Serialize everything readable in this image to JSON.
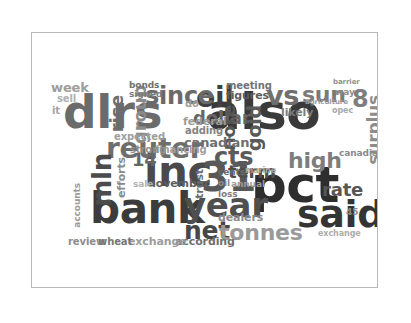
{
  "figure": {
    "background_color": "#ffffff",
    "axes_background_color": "#ffffff",
    "axes_border_color": "#b8b8b8",
    "title": "",
    "xlabel": "",
    "ylabel": ""
  },
  "chart_data": {
    "type": "wordcloud",
    "title": "",
    "subtitle": "",
    "xlabel": "",
    "ylabel": "",
    "legend": [],
    "grid": false,
    "axis_ticks_visible": false,
    "background_color": "#ffffff",
    "colormap": "grayscale",
    "words": [
      {
        "text": "dlrs",
        "weight": 100,
        "size": 47,
        "color": "#6b6b6b",
        "x": 31,
        "y": 56,
        "rotate": 0
      },
      {
        "text": "also",
        "weight": 97,
        "size": 50,
        "color": "#3a3a3a",
        "x": 175,
        "y": 55,
        "rotate": 0
      },
      {
        "text": "pct",
        "weight": 95,
        "size": 50,
        "color": "#2e2e2e",
        "x": 219,
        "y": 128,
        "rotate": 0
      },
      {
        "text": "bank",
        "weight": 88,
        "size": 42,
        "color": "#3c3c3c",
        "x": 58,
        "y": 155,
        "rotate": 0
      },
      {
        "text": "said",
        "weight": 84,
        "size": 38,
        "color": "#343434",
        "x": 265,
        "y": 163,
        "rotate": 0
      },
      {
        "text": "inc",
        "weight": 80,
        "size": 42,
        "color": "#4a4a4a",
        "x": 112,
        "y": 118,
        "rotate": 0
      },
      {
        "text": "31",
        "weight": 76,
        "size": 40,
        "color": "#585858",
        "x": 169,
        "y": 125,
        "rotate": 0
      },
      {
        "text": "year",
        "weight": 74,
        "size": 34,
        "color": "#4f4f4f",
        "x": 152,
        "y": 156,
        "rotate": 0
      },
      {
        "text": "reuter",
        "weight": 70,
        "size": 28,
        "color": "#6e6e6e",
        "x": 74,
        "y": 102,
        "rotate": 0
      },
      {
        "text": "oil",
        "weight": 66,
        "size": 28,
        "color": "#3f3f3f",
        "x": 164,
        "y": 51,
        "rotate": 0
      },
      {
        "text": "since",
        "weight": 62,
        "size": 24,
        "color": "#6a6a6a",
        "x": 113,
        "y": 52,
        "rotate": 0
      },
      {
        "text": "vs",
        "weight": 60,
        "size": 27,
        "color": "#6f6f6f",
        "x": 234,
        "y": 50,
        "rotate": 0
      },
      {
        "text": "net",
        "weight": 57,
        "size": 25,
        "color": "#474747",
        "x": 152,
        "y": 186,
        "rotate": 0
      },
      {
        "text": "cts",
        "weight": 55,
        "size": 24,
        "color": "#5b5b5b",
        "x": 182,
        "y": 113,
        "rotate": 0
      },
      {
        "text": "tonnes",
        "weight": 52,
        "size": 22,
        "color": "#9a9a9a",
        "x": 187,
        "y": 189,
        "rotate": 0
      },
      {
        "text": "mln",
        "weight": 50,
        "size": 26,
        "color": "#4c4c4c",
        "x": 58,
        "y": 120,
        "rotate": -90
      },
      {
        "text": "high",
        "weight": 48,
        "size": 22,
        "color": "#7d7d7d",
        "x": 256,
        "y": 117,
        "rotate": 0
      },
      {
        "text": "dollar",
        "weight": 46,
        "size": 18,
        "color": "#666666",
        "x": 161,
        "y": 76,
        "rotate": 0
      },
      {
        "text": "gold",
        "weight": 45,
        "size": 19,
        "color": "#5a5a5a",
        "x": 213,
        "y": 72,
        "rotate": -90
      },
      {
        "text": "term",
        "weight": 44,
        "size": 18,
        "color": "#4e4e4e",
        "x": 196,
        "y": 130,
        "rotate": 0
      },
      {
        "text": "rate",
        "weight": 43,
        "size": 18,
        "color": "#565656",
        "x": 290,
        "y": 148,
        "rotate": 0
      },
      {
        "text": "note",
        "weight": 42,
        "size": 18,
        "color": "#565656",
        "x": 188,
        "y": 72,
        "rotate": -90
      },
      {
        "text": "rise",
        "weight": 41,
        "size": 18,
        "color": "#6c6c6c",
        "x": 76,
        "y": 62,
        "rotate": -90
      },
      {
        "text": "group",
        "weight": 40,
        "size": 18,
        "color": "#8b8b8b",
        "x": 99,
        "y": 52,
        "rotate": -90
      },
      {
        "text": "surplus",
        "weight": 39,
        "size": 17,
        "color": "#8d8d8d",
        "x": 334,
        "y": 62,
        "rotate": -90
      },
      {
        "text": "sun",
        "weight": 38,
        "size": 22,
        "color": "#7a7a7a",
        "x": 270,
        "y": 51,
        "rotate": 0
      },
      {
        "text": "canadian",
        "weight": 36,
        "size": 13,
        "color": "#6f6f6f",
        "x": 152,
        "y": 104,
        "rotate": 0
      },
      {
        "text": "8",
        "weight": 35,
        "size": 24,
        "color": "#7e7e7e",
        "x": 320,
        "y": 55,
        "rotate": 0
      },
      {
        "text": "14",
        "weight": 34,
        "size": 18,
        "color": "#666666",
        "x": 100,
        "y": 118,
        "rotate": 0
      },
      {
        "text": "according",
        "weight": 32,
        "size": 11,
        "color": "#6f6f6f",
        "x": 143,
        "y": 204,
        "rotate": 0
      },
      {
        "text": "november",
        "weight": 31,
        "size": 11,
        "color": "#5f5f5f",
        "x": 116,
        "y": 146,
        "rotate": 0
      },
      {
        "text": "exchange",
        "weight": 30,
        "size": 11,
        "color": "#9c9c9c",
        "x": 96,
        "y": 204,
        "rotate": 0
      },
      {
        "text": "dealers",
        "weight": 29,
        "size": 11,
        "color": "#8a8a8a",
        "x": 186,
        "y": 180,
        "rotate": 0
      },
      {
        "text": "federal",
        "weight": 28,
        "size": 11,
        "color": "#9b9b9b",
        "x": 151,
        "y": 84,
        "rotate": 0
      },
      {
        "text": "figures",
        "weight": 28,
        "size": 11,
        "color": "#5c5c5c",
        "x": 194,
        "y": 58,
        "rotate": 0
      },
      {
        "text": "meeting",
        "weight": 27,
        "size": 10,
        "color": "#737373",
        "x": 194,
        "y": 48,
        "rotate": 0
      },
      {
        "text": "likely",
        "weight": 27,
        "size": 11,
        "color": "#7b7b7b",
        "x": 249,
        "y": 75,
        "rotate": 0
      },
      {
        "text": "expected",
        "weight": 26,
        "size": 10,
        "color": "#9e9e9e",
        "x": 82,
        "y": 99,
        "rotate": 0
      },
      {
        "text": "financing",
        "weight": 25,
        "size": 10,
        "color": "#a0a0a0",
        "x": 123,
        "y": 112,
        "rotate": 0
      },
      {
        "text": "strong",
        "weight": 25,
        "size": 10,
        "color": "#8f8f8f",
        "x": 98,
        "y": 112,
        "rotate": 0
      },
      {
        "text": "adding",
        "weight": 24,
        "size": 10,
        "color": "#848484",
        "x": 153,
        "y": 93,
        "rotate": 0
      },
      {
        "text": "signed",
        "weight": 24,
        "size": 9,
        "color": "#7c7c7c",
        "x": 97,
        "y": 57,
        "rotate": 0
      },
      {
        "text": "bonds",
        "weight": 23,
        "size": 9,
        "color": "#707070",
        "x": 97,
        "y": 48,
        "rotate": 0
      },
      {
        "text": "week",
        "weight": 23,
        "size": 13,
        "color": "#9d9d9d",
        "x": 19,
        "y": 49,
        "rotate": 0
      },
      {
        "text": "sell",
        "weight": 22,
        "size": 10,
        "color": "#b0b0b0",
        "x": 25,
        "y": 61,
        "rotate": 0
      },
      {
        "text": "trust",
        "weight": 22,
        "size": 11,
        "color": "#6b6b6b",
        "x": 163,
        "y": 136,
        "rotate": -90
      },
      {
        "text": "efforts",
        "weight": 21,
        "size": 11,
        "color": "#8b8b8b",
        "x": 85,
        "y": 124,
        "rotate": -90
      },
      {
        "text": "accounts",
        "weight": 21,
        "size": 9,
        "color": "#9a9a9a",
        "x": 41,
        "y": 150,
        "rotate": -90
      },
      {
        "text": "sale",
        "weight": 20,
        "size": 9,
        "color": "#b2b2b2",
        "x": 101,
        "y": 147,
        "rotate": 0
      },
      {
        "text": "review",
        "weight": 20,
        "size": 10,
        "color": "#8d8d8d",
        "x": 36,
        "y": 204,
        "rotate": 0
      },
      {
        "text": "wheat",
        "weight": 20,
        "size": 10,
        "color": "#777777",
        "x": 66,
        "y": 204,
        "rotate": 0
      },
      {
        "text": "annual",
        "weight": 19,
        "size": 9,
        "color": "#9d9d9d",
        "x": 199,
        "y": 147,
        "rotate": 0
      },
      {
        "text": "cents",
        "weight": 19,
        "size": 9,
        "color": "#6a6a6a",
        "x": 186,
        "y": 135,
        "rotate": 0
      },
      {
        "text": "oil",
        "weight": 18,
        "size": 9,
        "color": "#8b8b8b",
        "x": 186,
        "y": 146,
        "rotate": 0
      },
      {
        "text": "loss",
        "weight": 18,
        "size": 9,
        "color": "#7f7f7f",
        "x": 186,
        "y": 157,
        "rotate": 0
      },
      {
        "text": "marine",
        "weight": 17,
        "size": 8,
        "color": "#a5a5a5",
        "x": 213,
        "y": 134,
        "rotate": 0
      },
      {
        "text": "45",
        "weight": 16,
        "size": 9,
        "color": "#8c8c8c",
        "x": 314,
        "y": 175,
        "rotate": 0
      },
      {
        "text": "exchange",
        "weight": 16,
        "size": 8,
        "color": "#adadad",
        "x": 286,
        "y": 197,
        "rotate": 0
      },
      {
        "text": "way",
        "weight": 16,
        "size": 9,
        "color": "#8f8f8f",
        "x": 303,
        "y": 55,
        "rotate": 0
      },
      {
        "text": "barrier",
        "weight": 15,
        "size": 7,
        "color": "#909090",
        "x": 301,
        "y": 46,
        "rotate": 0
      },
      {
        "text": "agriculture",
        "weight": 15,
        "size": 7,
        "color": "#9b9b9b",
        "x": 273,
        "y": 66,
        "rotate": 0
      },
      {
        "text": "opec",
        "weight": 15,
        "size": 8,
        "color": "#a8a8a8",
        "x": 300,
        "y": 74,
        "rotate": 0
      },
      {
        "text": "canadian",
        "weight": 14,
        "size": 9,
        "color": "#8a8a8a",
        "x": 307,
        "y": 116,
        "rotate": 0
      },
      {
        "text": "do",
        "weight": 14,
        "size": 10,
        "color": "#9f9f9f",
        "x": 153,
        "y": 66,
        "rotate": 0
      },
      {
        "text": "it",
        "weight": 13,
        "size": 10,
        "color": "#a4a4a4",
        "x": 20,
        "y": 73,
        "rotate": 0
      }
    ]
  }
}
